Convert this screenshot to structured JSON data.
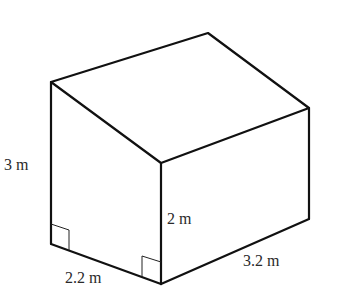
{
  "diagram": {
    "type": "3D prism (house-shaped solid with sloped roof)",
    "vertices": {
      "top_back": [
        208,
        33
      ],
      "left_top": [
        51,
        82
      ],
      "right_top": [
        309,
        108
      ],
      "front_top": [
        161,
        163
      ],
      "left_bottom": [
        51,
        244
      ],
      "front_bottom": [
        161,
        284
      ],
      "right_bottom": [
        309,
        219
      ]
    },
    "labels": {
      "left_height": "3 m",
      "front_height": "2 m",
      "width": "2.2 m",
      "length": "3.2 m"
    },
    "right_angle_markers": 2,
    "colors": {
      "stroke": "#111111",
      "text": "#2a2a2a",
      "background": "#ffffff"
    }
  }
}
